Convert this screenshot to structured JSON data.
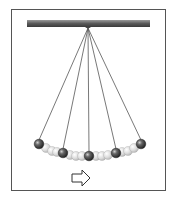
{
  "diagram": {
    "pivot": {
      "x": 88,
      "y": 28
    },
    "bar": {
      "x1": 27,
      "x2": 150,
      "y": 20,
      "height": 7,
      "color": "#6b6b6b"
    },
    "string_color": "#555555",
    "dark_balls": [
      {
        "x": 39,
        "y": 144
      },
      {
        "x": 63,
        "y": 153
      },
      {
        "x": 89,
        "y": 156
      },
      {
        "x": 116,
        "y": 153
      },
      {
        "x": 141,
        "y": 144
      }
    ],
    "light_balls": [
      {
        "x": 46,
        "y": 148
      },
      {
        "x": 52,
        "y": 151
      },
      {
        "x": 57,
        "y": 152
      },
      {
        "x": 70,
        "y": 155
      },
      {
        "x": 76,
        "y": 156
      },
      {
        "x": 82,
        "y": 156
      },
      {
        "x": 96,
        "y": 156
      },
      {
        "x": 102,
        "y": 156
      },
      {
        "x": 108,
        "y": 155
      },
      {
        "x": 122,
        "y": 152
      },
      {
        "x": 128,
        "y": 151
      },
      {
        "x": 134,
        "y": 148
      }
    ],
    "arrow": {
      "direction": "right",
      "x": 80,
      "y": 178
    }
  }
}
